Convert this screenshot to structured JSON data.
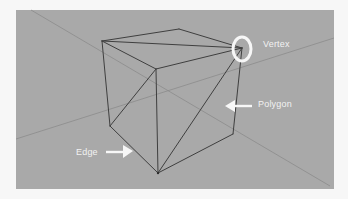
{
  "diagram": {
    "colors": {
      "background": "#f7f7f7",
      "viewport": "#a9a9a9",
      "wireframe": "#3f3f3f",
      "axis": "#8a8a8a",
      "annotation": "#f5f5f5"
    },
    "mesh": {
      "shape": "cube",
      "vertices": {
        "top_left": [
          102,
          41
        ],
        "top_back": [
          179,
          29
        ],
        "top_right": [
          242,
          48
        ],
        "top_front": [
          156,
          69
        ],
        "bottom_left": [
          110,
          126
        ],
        "bottom_front": [
          158,
          173
        ],
        "bottom_right": [
          233,
          134
        ]
      },
      "edges": [
        [
          "top_left",
          "top_back"
        ],
        [
          "top_back",
          "top_right"
        ],
        [
          "top_left",
          "top_front"
        ],
        [
          "top_front",
          "top_right"
        ],
        [
          "top_left",
          "top_right"
        ],
        [
          "top_left",
          "bottom_left"
        ],
        [
          "top_front",
          "bottom_front"
        ],
        [
          "top_right",
          "bottom_right"
        ],
        [
          "bottom_left",
          "bottom_front"
        ],
        [
          "bottom_front",
          "bottom_right"
        ],
        [
          "bottom_left",
          "top_front"
        ],
        [
          "bottom_front",
          "top_right"
        ]
      ]
    },
    "annotations": [
      {
        "id": "vertex",
        "label": "Vertex",
        "marker": "circle",
        "target": "top_right"
      },
      {
        "id": "polygon",
        "label": "Polygon",
        "marker": "arrow-left",
        "target": "right-face"
      },
      {
        "id": "edge",
        "label": "Edge",
        "marker": "arrow-right",
        "target": "bottom_left-bottom_front"
      }
    ]
  }
}
